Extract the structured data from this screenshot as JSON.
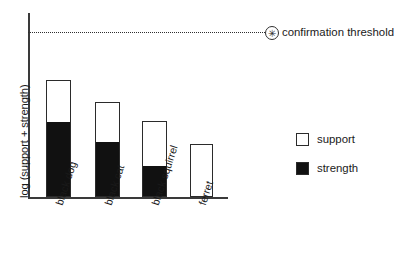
{
  "chart_data": {
    "type": "bar",
    "title": "",
    "subtitle": "",
    "xlabel": "",
    "ylabel": "log (support + strength)",
    "grid": false,
    "stacked": true,
    "categories": [
      "black dog",
      "black cat",
      "black squirrel",
      "ferret"
    ],
    "series": [
      {
        "name": "strength",
        "color": "#111111",
        "values": [
          63,
          50,
          29,
          0
        ]
      },
      {
        "name": "support",
        "color": "#ffffff",
        "values": [
          37,
          44,
          42,
          45
        ]
      }
    ],
    "totals": [
      100,
      94,
      71,
      45
    ],
    "ylim": [
      0,
      125
    ],
    "annotations": [
      {
        "name": "confirmation threshold",
        "label": "confirmation threshold",
        "marker": "asterisk-in-circle",
        "style": "dotted-horizontal-line",
        "value": 120
      }
    ],
    "legend": {
      "position": "right",
      "entries": [
        {
          "label": "support",
          "swatch": "hollow"
        },
        {
          "label": "strength",
          "swatch": "filled"
        }
      ]
    },
    "bars": [
      {
        "category": "black dog",
        "left": 46,
        "width": 25,
        "top": 80,
        "fill_top": 123
      },
      {
        "category": "black cat",
        "left": 95,
        "width": 25,
        "top": 102,
        "fill_top": 143
      },
      {
        "category": "black squirrel",
        "left": 142,
        "width": 25,
        "top": 121,
        "fill_top": 167
      },
      {
        "category": "ferret",
        "left": 190,
        "width": 23,
        "top": 144,
        "fill_top": 197
      }
    ],
    "tick_label_positions": [
      {
        "label": "black dog",
        "x": 53,
        "y": 203
      },
      {
        "label": "black cat",
        "x": 102,
        "y": 203
      },
      {
        "label": "black squirrel",
        "x": 149,
        "y": 203
      },
      {
        "label": "ferret",
        "x": 196,
        "y": 203
      }
    ]
  },
  "colors": {
    "background": "#ffffff",
    "axis": "#3a3a3a",
    "ink": "#1a1a1a",
    "strength_fill": "#111111",
    "support_fill": "#ffffff",
    "bar_stroke": "#2b2b2b",
    "threshold": "#2f2f2f"
  },
  "marker_glyph": "✳"
}
